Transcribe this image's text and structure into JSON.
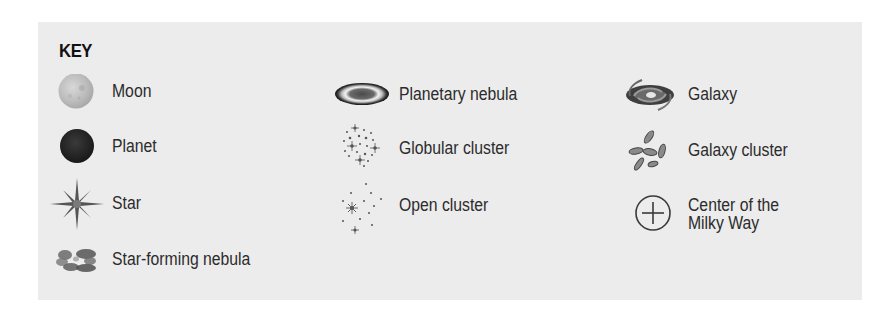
{
  "key": {
    "title": "KEY",
    "columns": [
      {
        "items": [
          {
            "icon": "moon-icon",
            "label": "Moon"
          },
          {
            "icon": "planet-icon",
            "label": "Planet"
          },
          {
            "icon": "star-icon",
            "label": "Star"
          },
          {
            "icon": "star-forming-nebula-icon",
            "label": "Star-forming nebula"
          }
        ]
      },
      {
        "items": [
          {
            "icon": "planetary-nebula-icon",
            "label": "Planetary nebula"
          },
          {
            "icon": "globular-cluster-icon",
            "label": "Globular cluster"
          },
          {
            "icon": "open-cluster-icon",
            "label": "Open cluster"
          }
        ]
      },
      {
        "items": [
          {
            "icon": "galaxy-icon",
            "label": "Galaxy"
          },
          {
            "icon": "galaxy-cluster-icon",
            "label": "Galaxy cluster"
          },
          {
            "icon": "milky-way-center-icon",
            "label_line1": "Center of the",
            "label_line2": "Milky Way"
          }
        ]
      }
    ]
  },
  "colors": {
    "panel_background": "#ececec",
    "page_background": "#ffffff",
    "text": "#2b2b2b",
    "icon_dark": "#3a3a3a"
  }
}
